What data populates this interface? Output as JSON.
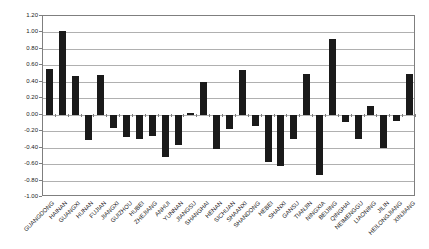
{
  "chart_data": {
    "type": "bar",
    "title": "",
    "xlabel": "",
    "ylabel": "",
    "legend": false,
    "grid": true,
    "ylim": [
      -1.0,
      1.2
    ],
    "ytick_interval": 0.2,
    "ytick_labels": [
      "1.20",
      "1.00",
      "0.80",
      "0.60",
      "0.40",
      "0.20",
      "0.00",
      "-0.20",
      "-0.40",
      "-0.60",
      "-0.80",
      "-1.00"
    ],
    "categories": [
      "GUANGDONG",
      "HAINAN",
      "GUANGXI",
      "HUNAN",
      "FUJIAN",
      "JIANGXI",
      "GUIZHOU",
      "HUBEI",
      "ZHEJIANG",
      "ANHUI",
      "YUNNAN",
      "JIANGSU",
      "SHANGHAI",
      "HENAN",
      "SICHUAN",
      "SHAANXI",
      "SHANDONG",
      "HEBEI",
      "SHANXI",
      "GANSU",
      "TIANJIN",
      "NINGXIA",
      "BEIJING",
      "QINGHAI",
      "NEIMENGGU",
      "LIAONING",
      "JILIN",
      "HEILONGJIANG",
      "XINJIANG"
    ],
    "values": [
      0.55,
      1.02,
      0.47,
      -0.31,
      0.48,
      -0.16,
      -0.27,
      -0.29,
      -0.26,
      -0.51,
      -0.37,
      0.02,
      0.4,
      -0.42,
      -0.17,
      0.54,
      -0.14,
      -0.58,
      -0.62,
      -0.3,
      0.5,
      -0.73,
      0.92,
      -0.09,
      -0.29,
      0.11,
      -0.4,
      -0.08,
      0.5
    ],
    "colors": {
      "bar": "#1a1a1a",
      "gridline": "#b0b0b0",
      "border": "#7f7f7f",
      "background": "#ffffff",
      "text": "#1a1a1a"
    }
  }
}
